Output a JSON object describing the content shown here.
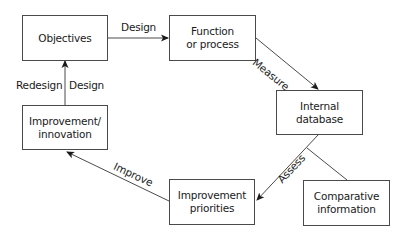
{
  "diagram": {
    "nodes": [
      {
        "id": "objectives",
        "label": "Objectives"
      },
      {
        "id": "function",
        "label": "Function\nor process"
      },
      {
        "id": "internal_db",
        "label": "Internal\ndatabase"
      },
      {
        "id": "comparative",
        "label": "Comparative\ninformation"
      },
      {
        "id": "priorities",
        "label": "Improvement\npriorities"
      },
      {
        "id": "innovation",
        "label": "Improvement/\ninnovation"
      }
    ],
    "edges": [
      {
        "from": "objectives",
        "to": "function",
        "label": "Design"
      },
      {
        "from": "function",
        "to": "internal_db",
        "label": "Measure"
      },
      {
        "from": "internal_db",
        "to": "priorities",
        "label": "Assess"
      },
      {
        "from": "comparative",
        "to": "assess_line",
        "label": ""
      },
      {
        "from": "priorities",
        "to": "innovation",
        "label": "Improve"
      },
      {
        "from": "innovation",
        "to": "objectives",
        "label_left": "Redesign",
        "label_right": "Design"
      }
    ],
    "colors": {
      "line": "#4a4a4a",
      "text": "#1a1a1a",
      "background": "#ffffff"
    }
  }
}
